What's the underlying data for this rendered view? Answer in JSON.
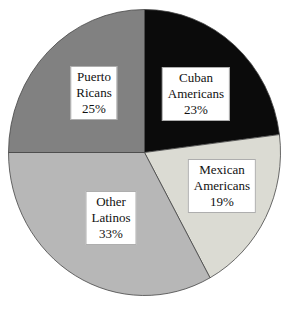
{
  "page": {
    "background_color": "#ffffff",
    "width": 288,
    "height": 313
  },
  "chart_data": {
    "type": "pie",
    "title": "",
    "xlabel": "",
    "ylabel": "",
    "direction": "clockwise",
    "start_angle_deg": 0,
    "total": 100,
    "legend": "none (labels drawn in white boxes on slices)",
    "categories": [
      "Cuban Americans",
      "Mexican Americans",
      "Other Latinos",
      "Puerto Ricans"
    ],
    "values": [
      23,
      19,
      33,
      25
    ],
    "slices": [
      {
        "id": "cuban-americans",
        "name": "Cuban Americans",
        "value": 23,
        "percent_label": "23%",
        "lines": [
          "Cuban",
          "Americans",
          "23%"
        ],
        "color": "#0b0b0b",
        "label_pos": {
          "x": 196,
          "y": 94
        }
      },
      {
        "id": "mexican-americans",
        "name": "Mexican Americans",
        "value": 19,
        "percent_label": "19%",
        "lines": [
          "Mexican",
          "Americans",
          "19%"
        ],
        "color": "#dbdbd3",
        "label_pos": {
          "x": 222,
          "y": 186
        }
      },
      {
        "id": "other-latinos",
        "name": "Other Latinos",
        "value": 33,
        "percent_label": "33%",
        "lines": [
          "Other",
          "Latinos",
          "33%"
        ],
        "color": "#b7b7b7",
        "label_pos": {
          "x": 111,
          "y": 218
        }
      },
      {
        "id": "puerto-ricans",
        "name": "Puerto Ricans",
        "value": 25,
        "percent_label": "25%",
        "lines": [
          "Puerto",
          "Ricans",
          "25%"
        ],
        "color": "#818181",
        "label_pos": {
          "x": 94,
          "y": 93
        }
      }
    ],
    "style": {
      "outline_color": "#454545",
      "outline_width": 0.8,
      "label_box_bg": "#ffffff",
      "label_box_border": "#828282",
      "label_text_color": "#111111"
    },
    "layout": {
      "cx": 144.5,
      "cy": 152.5,
      "rx": 136,
      "ry": 143,
      "width": 288,
      "height": 313,
      "grid": false
    }
  }
}
